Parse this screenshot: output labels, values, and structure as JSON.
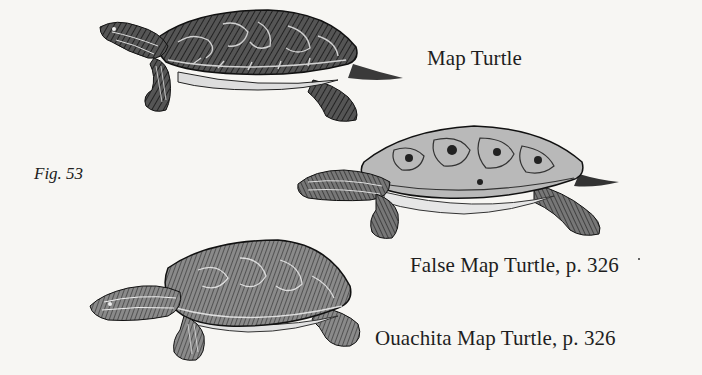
{
  "figure": {
    "label": "Fig. 53"
  },
  "illustrations": [
    {
      "name": "map-turtle",
      "caption": "Map Turtle"
    },
    {
      "name": "false-map-turtle",
      "caption": "False Map Turtle, p. 326"
    },
    {
      "name": "ouachita-map-turtle",
      "caption": "Ouachita Map Turtle, p. 326"
    }
  ],
  "colors": {
    "paper": "#f7f6f3",
    "ink": "#1c1c1c"
  }
}
